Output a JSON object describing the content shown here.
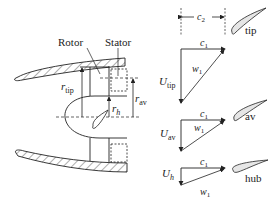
{
  "labels": {
    "rotor": "Rotor",
    "stator": "Stator",
    "r_tip": "r",
    "r_tip_sub": "tip",
    "r_h": "r",
    "r_h_sub": "h",
    "r_av": "r",
    "r_av_sub": "av",
    "c2": "c",
    "c2_sub": "2"
  },
  "triangles": [
    {
      "position": "tip",
      "blade_label": "tip",
      "U": "U",
      "U_sub": "tip",
      "c": "c",
      "c_sub": "1",
      "w": "w",
      "w_sub": "1"
    },
    {
      "position": "av",
      "blade_label": "av",
      "U": "U",
      "U_sub": "av",
      "c": "c",
      "c_sub": "1",
      "w": "w",
      "w_sub": "1"
    },
    {
      "position": "hub",
      "blade_label": "hub",
      "U": "U",
      "U_sub": "h",
      "c": "c",
      "c_sub": "1",
      "w": "w",
      "w_sub": "1"
    }
  ],
  "colors": {
    "line": "#222222",
    "blade_fill": "#e6e6e6"
  }
}
